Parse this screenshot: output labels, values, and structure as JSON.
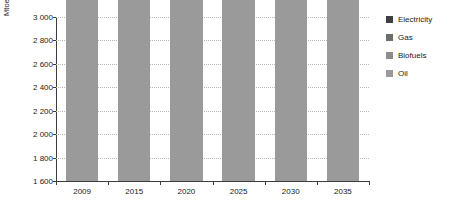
{
  "chart_data": {
    "type": "bar",
    "stacked": true,
    "title": "",
    "subtitle": "",
    "xlabel": "",
    "ylabel": "Mtoe",
    "ylim": [
      1600,
      3000
    ],
    "ytick_step": 200,
    "ytick_labels": [
      "3 000",
      "2 800",
      "2 600",
      "2 400",
      "2 200",
      "2 000",
      "1 800",
      "1 600"
    ],
    "ytick_values": [
      3000,
      2800,
      2600,
      2400,
      2200,
      2000,
      1800,
      1600
    ],
    "grid": true,
    "legend_position": "right",
    "categories": [
      "2009",
      "2015",
      "2020",
      "2025",
      "2030",
      "2035"
    ],
    "series": [
      {
        "name": "Oil",
        "color": "#9a9a9a",
        "values": [
          2170,
          2330,
          2400,
          2465,
          2520,
          2565
        ]
      },
      {
        "name": "Biofuels",
        "color": "#8c8c8c",
        "values": [
          55,
          65,
          80,
          95,
          110,
          125
        ]
      },
      {
        "name": "Gas",
        "color": "#6e6e6e",
        "values": [
          40,
          55,
          70,
          85,
          95,
          110
        ]
      },
      {
        "name": "Electricity",
        "color": "#3f3f3f",
        "values": [
          15,
          30,
          45,
          60,
          75,
          90
        ]
      }
    ],
    "totals": [
      2280,
      2480,
      2595,
      2705,
      2800,
      2890
    ]
  },
  "legend": {
    "items": [
      {
        "label": "Electricity",
        "color": "#3f3f3f"
      },
      {
        "label": "Gas",
        "color": "#6e6e6e"
      },
      {
        "label": "Biofuels",
        "color": "#8c8c8c"
      },
      {
        "label": "Oil",
        "color": "#9a9a9a"
      }
    ]
  },
  "axes": {
    "y_title": "Mtoe"
  }
}
